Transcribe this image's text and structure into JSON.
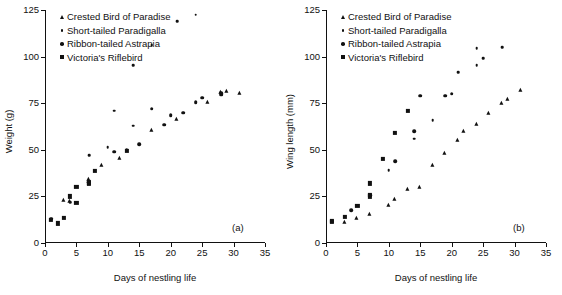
{
  "figure": {
    "panels": [
      {
        "tag": "(a)",
        "name": "panel-a",
        "ylabel": "Weight (g)",
        "xlabel": "Days of nestling life"
      },
      {
        "tag": "(b)",
        "name": "panel-b",
        "ylabel": "Wing length (mm)",
        "xlabel": "Days of nestling life"
      }
    ],
    "legend": [
      {
        "label": "Crested Bird of Paradise",
        "marker": "triangle"
      },
      {
        "label": "Short-tailed Paradigalla",
        "marker": "dot-small"
      },
      {
        "label": "Ribbon-tailed Astrapia",
        "marker": "dot-medium"
      },
      {
        "label": "Victoria's Riflebird",
        "marker": "square"
      }
    ],
    "colors": {
      "ink": "#111111",
      "background": "#ffffff"
    }
  },
  "chart_data": [
    {
      "type": "scatter",
      "panel": "(a)",
      "title": "",
      "xlabel": "Days of nestling life",
      "ylabel": "Weight (g)",
      "xlim": [
        0,
        35
      ],
      "ylim": [
        0,
        125
      ],
      "xticks": [
        0,
        5,
        10,
        15,
        20,
        25,
        30,
        35
      ],
      "yticks": [
        0,
        25,
        50,
        75,
        100,
        125
      ],
      "grid": false,
      "legend_position": "top-left",
      "series": [
        {
          "name": "Crested Bird of Paradise",
          "marker": "triangle",
          "points": [
            [
              3,
              23.0
            ],
            [
              4,
              22.5
            ],
            [
              7,
              34.5
            ],
            [
              7,
              33.0
            ],
            [
              9,
              42.0
            ],
            [
              12,
              45.5
            ],
            [
              17,
              60.5
            ],
            [
              21,
              66.5
            ],
            [
              26,
              75.5
            ],
            [
              28,
              81.0
            ],
            [
              29,
              81.5
            ],
            [
              31,
              80.5
            ]
          ]
        },
        {
          "name": "Short-tailed Paradigalla",
          "marker": "dot-small",
          "points": [
            [
              4,
              22.0
            ],
            [
              7,
              47.0
            ],
            [
              10,
              51.5
            ],
            [
              11,
              71.0
            ],
            [
              14,
              63.0
            ],
            [
              14,
              95.5
            ],
            [
              17,
              106.0
            ],
            [
              21,
              119.0
            ],
            [
              24,
              122.5
            ]
          ]
        },
        {
          "name": "Ribbon-tailed Astrapia",
          "marker": "dot-medium",
          "points": [
            [
              1,
              13.0
            ],
            [
              11,
              49.0
            ],
            [
              13,
              50.0
            ],
            [
              15,
              53.0
            ],
            [
              17,
              72.0
            ],
            [
              19,
              63.5
            ],
            [
              20,
              68.5
            ],
            [
              22,
              70.0
            ],
            [
              24,
              75.5
            ],
            [
              25,
              78.0
            ],
            [
              28,
              79.5
            ],
            [
              28,
              80.5
            ]
          ]
        },
        {
          "name": "Victoria's Riflebird",
          "marker": "square",
          "points": [
            [
              1,
              12.5
            ],
            [
              2,
              10.5
            ],
            [
              3,
              13.5
            ],
            [
              4,
              25.0
            ],
            [
              5,
              21.5
            ],
            [
              5,
              30.0
            ],
            [
              7,
              32.0
            ],
            [
              7,
              32.5
            ],
            [
              8,
              38.5
            ],
            [
              13,
              49.5
            ]
          ]
        }
      ]
    },
    {
      "type": "scatter",
      "panel": "(b)",
      "title": "",
      "xlabel": "Days of nestling life",
      "ylabel": "Wing length (mm)",
      "xlim": [
        0,
        35
      ],
      "ylim": [
        0,
        125
      ],
      "xticks": [
        0,
        5,
        10,
        15,
        20,
        25,
        30,
        35
      ],
      "yticks": [
        0,
        25,
        50,
        75,
        100,
        125
      ],
      "grid": false,
      "legend_position": "top-left",
      "series": [
        {
          "name": "Crested Bird of Paradise",
          "marker": "triangle",
          "points": [
            [
              3,
              11.5
            ],
            [
              5,
              13.5
            ],
            [
              7,
              15.5
            ],
            [
              10,
              20.5
            ],
            [
              11,
              23.5
            ],
            [
              13,
              29.0
            ],
            [
              15,
              30.0
            ],
            [
              17,
              42.0
            ],
            [
              19,
              48.5
            ],
            [
              21,
              55.5
            ],
            [
              22,
              60.0
            ],
            [
              24,
              64.0
            ],
            [
              26,
              70.0
            ],
            [
              28,
              75.0
            ],
            [
              29,
              77.0
            ],
            [
              31,
              82.0
            ]
          ]
        },
        {
          "name": "Short-tailed Paradigalla",
          "marker": "dot-small",
          "points": [
            [
              10,
              39.0
            ],
            [
              14,
              56.0
            ],
            [
              17,
              66.0
            ],
            [
              21,
              91.5
            ],
            [
              24,
              95.5
            ],
            [
              24,
              104.5
            ],
            [
              25,
              99.0
            ],
            [
              28,
              105.0
            ]
          ]
        },
        {
          "name": "Ribbon-tailed Astrapia",
          "marker": "dot-medium",
          "points": [
            [
              4,
              17.5
            ],
            [
              7,
              25.5
            ],
            [
              11,
              44.0
            ],
            [
              14,
              60.0
            ],
            [
              15,
              79.0
            ],
            [
              19,
              79.0
            ],
            [
              20,
              80.0
            ]
          ]
        },
        {
          "name": "Victoria's Riflebird",
          "marker": "square",
          "points": [
            [
              1,
              12.0
            ],
            [
              1,
              11.5
            ],
            [
              3,
              14.0
            ],
            [
              5,
              20.0
            ],
            [
              7,
              25.0
            ],
            [
              7,
              26.0
            ],
            [
              7,
              32.0
            ],
            [
              9,
              45.0
            ],
            [
              11,
              59.0
            ],
            [
              13,
              71.0
            ]
          ]
        }
      ]
    }
  ]
}
